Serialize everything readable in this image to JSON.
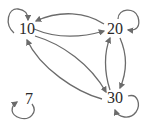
{
  "diagram": {
    "type": "directed-graph",
    "edge_color": "#6b6b6b",
    "label_color": "#2a2a2a",
    "nodes": [
      {
        "id": "n10",
        "label": "10",
        "x": 27,
        "y": 29
      },
      {
        "id": "n20",
        "label": "20",
        "x": 115,
        "y": 29
      },
      {
        "id": "n30",
        "label": "30",
        "x": 115,
        "y": 98
      },
      {
        "id": "n7",
        "label": "7",
        "x": 29,
        "y": 99
      }
    ],
    "edges": [
      {
        "from": "10",
        "to": "10",
        "kind": "self-loop"
      },
      {
        "from": "20",
        "to": "20",
        "kind": "self-loop"
      },
      {
        "from": "30",
        "to": "30",
        "kind": "self-loop"
      },
      {
        "from": "7",
        "to": "7",
        "kind": "self-loop"
      },
      {
        "from": "20",
        "to": "10"
      },
      {
        "from": "10",
        "to": "20"
      },
      {
        "from": "10",
        "to": "30"
      },
      {
        "from": "30",
        "to": "10"
      },
      {
        "from": "20",
        "to": "30"
      },
      {
        "from": "30",
        "to": "20"
      }
    ]
  }
}
